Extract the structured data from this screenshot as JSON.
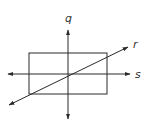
{
  "diagram": {
    "colors": {
      "stroke": "#2a2a2a",
      "label": "#333333",
      "background": "#ffffff"
    },
    "rectangle": {
      "x": 29,
      "y": 53,
      "width": 78,
      "height": 41
    },
    "lines": [
      {
        "label": "q",
        "orientation": "vertical",
        "x1": 68,
        "y1": 119,
        "x2": 68,
        "y2": 30
      },
      {
        "label": "s",
        "orientation": "horizontal",
        "x1": 8,
        "y1": 74,
        "x2": 130,
        "y2": 74
      },
      {
        "label": "r",
        "orientation": "diagonal",
        "x1": 9,
        "y1": 105,
        "x2": 128,
        "y2": 47
      }
    ],
    "labels": {
      "q": "q",
      "r": "r",
      "s": "s"
    }
  }
}
